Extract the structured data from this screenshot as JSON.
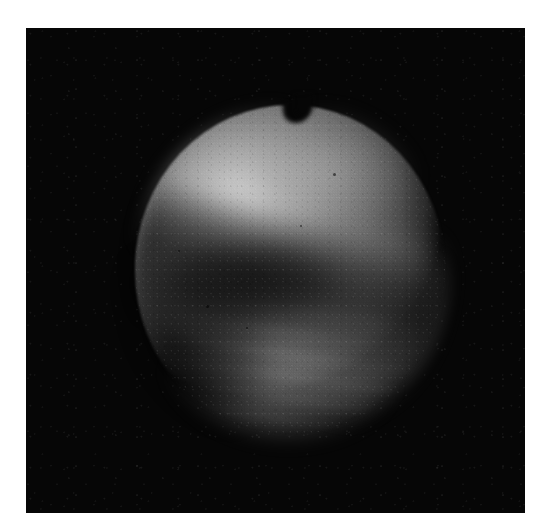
{
  "page": {
    "width_px": 544,
    "height_px": 532,
    "background_color": "#ffffff",
    "kind": "scanned-astronomical-photograph"
  },
  "plate": {
    "label": "photographic-plate",
    "x_px": 26,
    "y_px": 28,
    "width_px": 499,
    "height_px": 485,
    "sky_color": "#060606",
    "border_color": "#ffffff"
  },
  "subject": {
    "name": "planetary-disk",
    "description": "Illuminated disk of a cloud-covered planet, near-full phase, rendered in greyscale",
    "center_x_px": 290,
    "center_y_px": 270,
    "diameter_px": 310,
    "left_px": 135,
    "right_px": 445,
    "top_px": 105,
    "bottom_px": 435
  },
  "features": [
    {
      "name": "bright-northwest-cloud-region",
      "position": "upper-left quadrant",
      "center_x_px": 232,
      "center_y_px": 192,
      "relative_brightness": 0.82,
      "tone_hex": "#d7d7d7"
    },
    {
      "name": "bright-north-region",
      "position": "upper-centre-right",
      "center_x_px": 327,
      "center_y_px": 171,
      "relative_brightness": 0.62,
      "tone_hex": "#b0b0b0"
    },
    {
      "name": "dark-equatorial-band",
      "position": "diagonal across mid-disk, upper-right to lower-left",
      "angle_deg": 196,
      "center_x_px": 290,
      "center_y_px": 272,
      "relative_brightness": 0.17,
      "tone_hex": "#2c2c2c"
    },
    {
      "name": "dark-band-core",
      "position": "left-of-centre",
      "center_x_px": 221,
      "center_y_px": 255,
      "relative_brightness": 0.12,
      "tone_hex": "#1e1e1e"
    },
    {
      "name": "southwest-limb-shadow",
      "position": "lower-left limb",
      "center_x_px": 172,
      "center_y_px": 349,
      "relative_brightness": 0.06,
      "tone_hex": "#101010"
    },
    {
      "name": "bright-southeast-arc",
      "position": "lower-right quadrant",
      "center_x_px": 371,
      "center_y_px": 323,
      "relative_brightness": 0.58,
      "tone_hex": "#cdcdcd"
    },
    {
      "name": "bright-south-limb-arc",
      "position": "bottom-centre",
      "center_x_px": 278,
      "center_y_px": 389,
      "relative_brightness": 0.52,
      "tone_hex": "#bebebe"
    },
    {
      "name": "southern-striations",
      "position": "southern hemisphere",
      "center_x_px": 296,
      "center_y_px": 369,
      "relative_brightness": 0.4,
      "tone_hex": "#8a8a8a"
    },
    {
      "name": "top-terminator-notch",
      "position": "top-centre of limb",
      "center_x_px": 288,
      "center_y_px": 112,
      "width_px": 26,
      "depth_px": 16,
      "tone_hex": "#060606"
    }
  ],
  "specks": [
    {
      "x_px": 333,
      "y_px": 173,
      "size_px": 3
    },
    {
      "x_px": 206,
      "y_px": 305,
      "size_px": 3
    },
    {
      "x_px": 246,
      "y_px": 327,
      "size_px": 2
    },
    {
      "x_px": 178,
      "y_px": 250,
      "size_px": 2
    },
    {
      "x_px": 300,
      "y_px": 225,
      "size_px": 2
    }
  ],
  "tonal_scale": {
    "sky_black": "#060606",
    "limb_dark": "#121212",
    "mid_grey": "#6e6e6e",
    "cloud_grey": "#9d9d9d",
    "peak_white": "#d7d7d7"
  }
}
